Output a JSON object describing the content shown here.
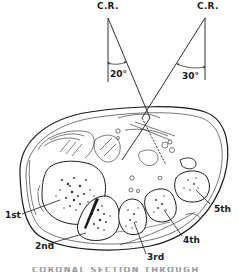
{
  "diagram": {
    "central_rays": [
      {
        "label": "C.R.",
        "angle_label": "20°",
        "side": "left"
      },
      {
        "label": "C.R.",
        "angle_label": "30°",
        "side": "right"
      }
    ],
    "metatarsal_labels": [
      "1st",
      "2nd",
      "3rd",
      "4th",
      "5th"
    ],
    "caption_partial": "CORONAL SECTION THROUGH"
  },
  "colors": {
    "line": "#1a1a1a",
    "background": "#ffffff",
    "stipple": "#333333"
  }
}
